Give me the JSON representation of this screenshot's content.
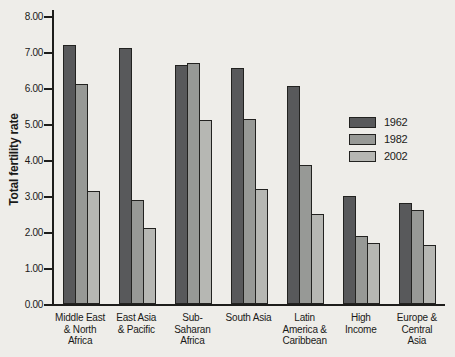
{
  "figure": {
    "background": "#eeede9",
    "axis_color": "#1d1d1b",
    "text_color": "#1a1a18"
  },
  "chart_data": {
    "type": "bar",
    "title": "",
    "xlabel": "",
    "ylabel": "Total fertility rate",
    "ylim": [
      0,
      8
    ],
    "ytick_step": 1,
    "ytick_labels": [
      "0.00",
      "1.00",
      "2.00",
      "3.00",
      "4.00",
      "5.00",
      "6.00",
      "7.00",
      "8.00"
    ],
    "grid": false,
    "legend_position": "center-right",
    "categories": [
      "Middle East & North Africa",
      "East Asia & Pacific",
      "Sub-Saharan Africa",
      "South Asia",
      "Latin America & Caribbean",
      "High Income",
      "Europe & Central Asia"
    ],
    "category_lines": [
      [
        "Middle East",
        "& North",
        "Africa"
      ],
      [
        "East Asia",
        "& Pacific"
      ],
      [
        "Sub-",
        "Saharan",
        "Africa"
      ],
      [
        "South Asia"
      ],
      [
        "Latin",
        "America &",
        "Caribbean"
      ],
      [
        "High",
        "Income"
      ],
      [
        "Europe &",
        "Central",
        "Asia"
      ]
    ],
    "series": [
      {
        "name": "1962",
        "color": "#58595b",
        "values": [
          7.2,
          7.1,
          6.65,
          6.55,
          6.05,
          3.0,
          2.8
        ]
      },
      {
        "name": "1982",
        "color": "#979996",
        "values": [
          6.1,
          2.9,
          6.7,
          5.15,
          3.85,
          1.9,
          2.6
        ]
      },
      {
        "name": "2002",
        "color": "#b6b7b3",
        "values": [
          3.15,
          2.1,
          5.1,
          3.2,
          2.5,
          1.7,
          1.65
        ]
      }
    ]
  }
}
